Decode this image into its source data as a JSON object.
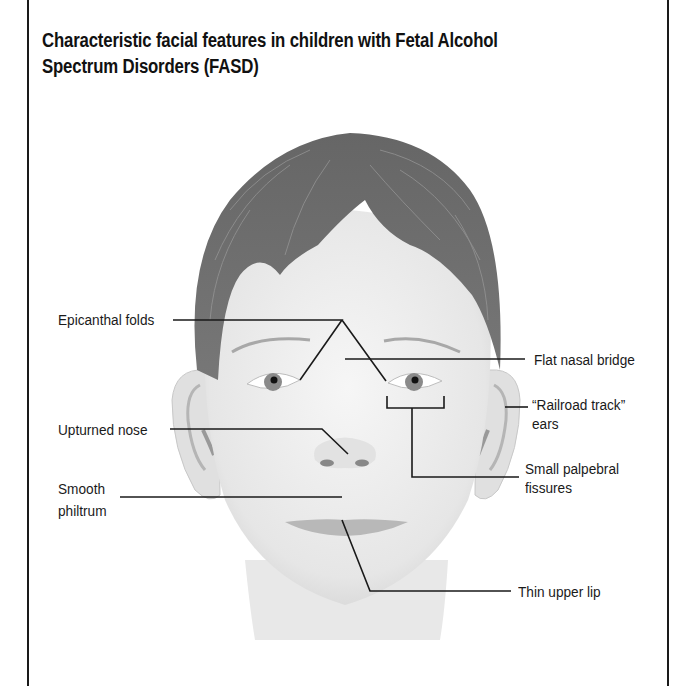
{
  "figure": {
    "title_line1": "Characteristic facial features in children with Fetal Alcohol",
    "title_line2": "Spectrum Disorders (FASD)",
    "illustration": "child-face-front-view",
    "labels": {
      "epicanthal_folds": "Epicanthal folds",
      "flat_nasal_bridge": "Flat nasal bridge",
      "railroad_track_ears_line1": "“Railroad track”",
      "railroad_track_ears_line2": "ears",
      "upturned_nose": "Upturned nose",
      "small_palpebral_fissures_line1": "Small palpebral",
      "small_palpebral_fissures_line2": "fissures",
      "smooth_philtrum_line1": "Smooth",
      "smooth_philtrum_line2": "philtrum",
      "thin_upper_lip": "Thin upper lip"
    },
    "colors": {
      "hair": "#6e6e6e",
      "skin": "#ececec",
      "lines": "#1a1a1a",
      "border": "#1a1a1a"
    }
  }
}
